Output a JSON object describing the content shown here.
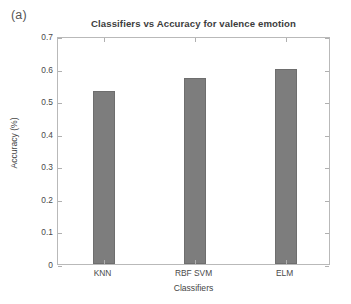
{
  "figure": {
    "subfigure_label": "(a)"
  },
  "chart_data": {
    "type": "bar",
    "title": "Classifiers vs Accuracy for valence emotion",
    "xlabel": "Classifiers",
    "ylabel": "Accuracy (%)",
    "categories": [
      "KNN",
      "RBF SVM",
      "ELM"
    ],
    "values": [
      0.53,
      0.57,
      0.6
    ],
    "ylim": [
      0,
      0.7
    ],
    "ytick_labels": [
      "0",
      "0.1",
      "0.2",
      "0.3",
      "0.4",
      "0.5",
      "0.6",
      "0.7"
    ],
    "ytick_values": [
      0,
      0.1,
      0.2,
      0.3,
      0.4,
      0.5,
      0.6,
      0.7
    ],
    "grid": false,
    "legend": "none",
    "bar_color": "#7d7d7d",
    "bar_edge_color": "#6e6e6e",
    "axes_color": "#b9b9b9",
    "background": "#ffffff"
  }
}
